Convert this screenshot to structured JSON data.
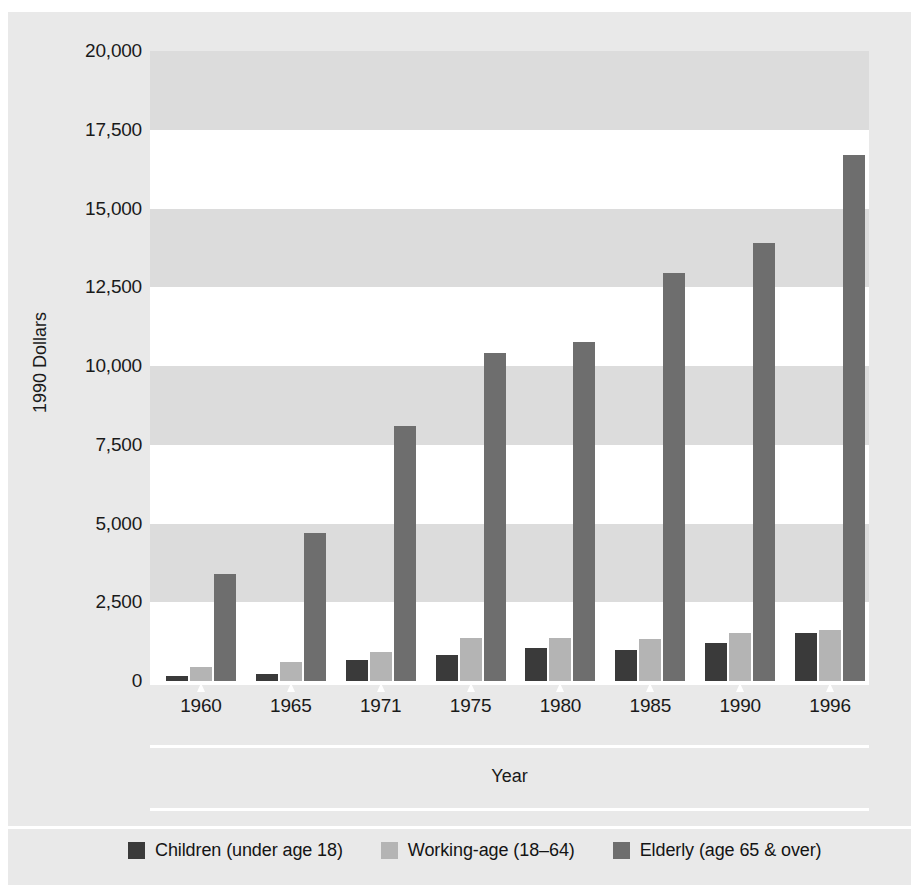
{
  "chart_data": {
    "type": "bar",
    "title": "",
    "subtitle": "",
    "xlabel": "Year",
    "ylabel": "1990 Dollars",
    "categories": [
      "1960",
      "1965",
      "1971",
      "1975",
      "1980",
      "1985",
      "1990",
      "1996"
    ],
    "series": [
      {
        "name": "Children (under age 18)",
        "color": "#3a3a3a",
        "values": [
          170,
          220,
          680,
          830,
          1050,
          980,
          1200,
          1540
        ]
      },
      {
        "name": "Working-age (18–64)",
        "color": "#b4b4b4",
        "values": [
          450,
          590,
          920,
          1380,
          1370,
          1340,
          1540,
          1620
        ]
      },
      {
        "name": "Elderly (age 65 & over)",
        "color": "#6e6e6e",
        "values": [
          3400,
          4700,
          8100,
          10400,
          10750,
          12950,
          13900,
          16700
        ]
      }
    ],
    "ylim": [
      0,
      20000
    ],
    "y_ticks": [
      0,
      2500,
      5000,
      7500,
      10000,
      12500,
      15000,
      17500,
      20000
    ],
    "y_tick_labels": [
      "0",
      "2,500",
      "5,000",
      "7,500",
      "10,000",
      "12,500",
      "15,000",
      "17,500",
      "20,000"
    ],
    "grid": "alternating-horizontal-bands",
    "legend_position": "bottom-left",
    "bar_group_order": [
      "Children (under age 18)",
      "Working-age (18–64)",
      "Elderly (age 65 & over)"
    ]
  },
  "axes": {
    "y_title": "1990 Dollars",
    "x_title": "Year"
  },
  "legend": {
    "items": [
      {
        "label": "Children (under age 18)",
        "color": "#3a3a3a"
      },
      {
        "label": "Working-age (18–64)",
        "color": "#b4b4b4"
      },
      {
        "label": "Elderly (age 65 & over)",
        "color": "#6e6e6e"
      }
    ]
  }
}
